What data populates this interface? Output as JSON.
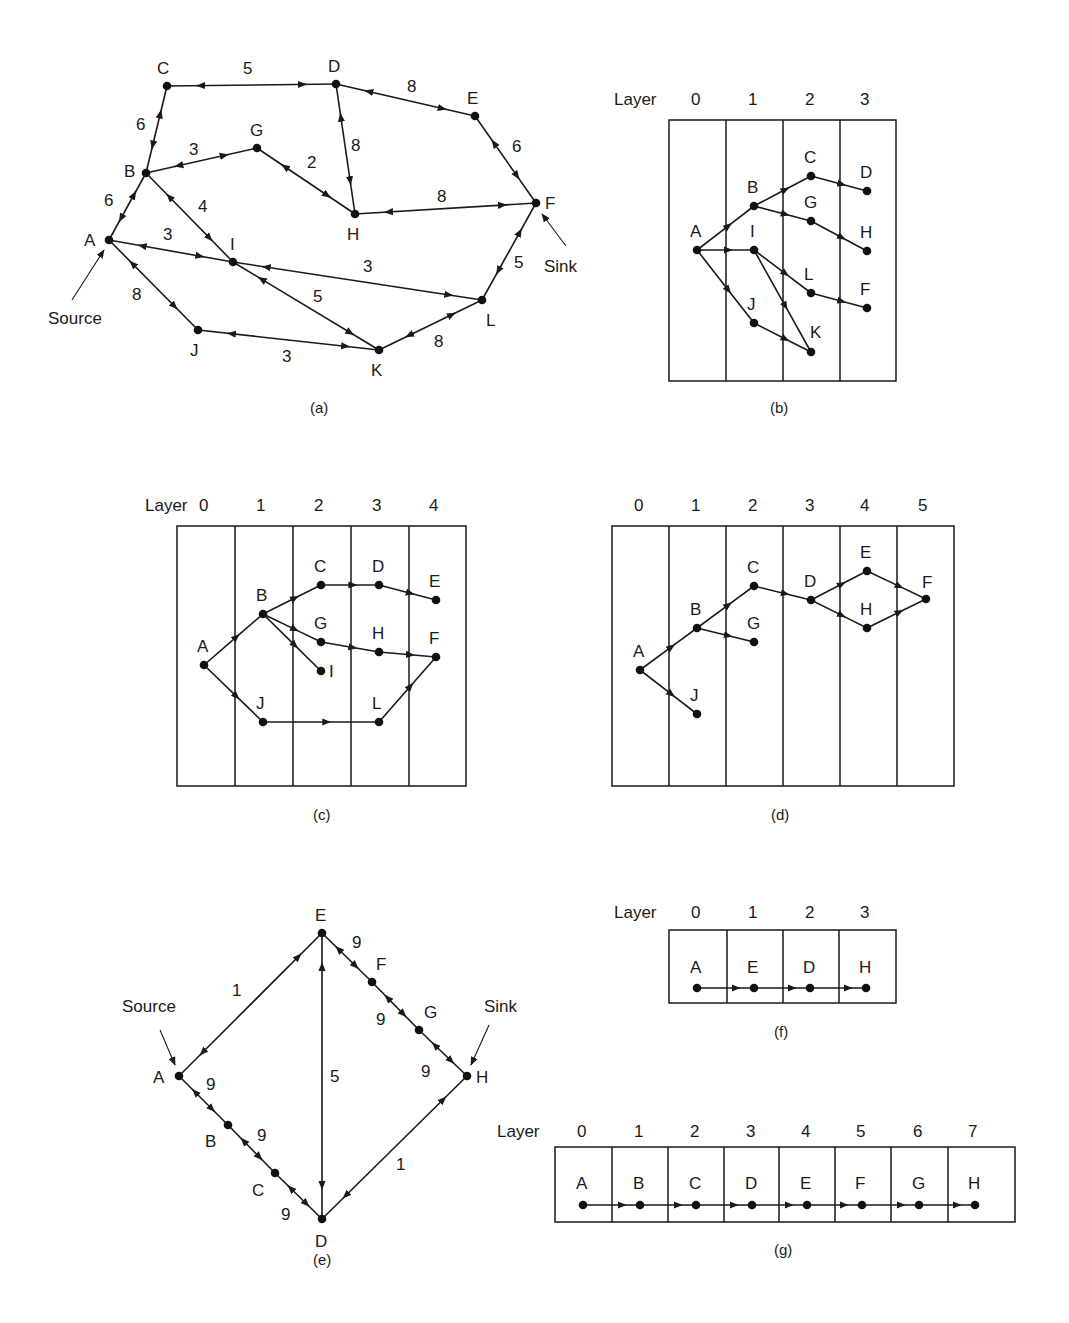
{
  "figure": {
    "panels": [
      {
        "id": "a",
        "caption": "(a)",
        "type": "weighted-bidirectional-graph",
        "source_label": "Source",
        "sink_label": "Sink",
        "source_node": "A",
        "sink_node": "F",
        "nodes": [
          {
            "id": "A",
            "x": 109,
            "y": 240,
            "lx": 84,
            "ly": 246
          },
          {
            "id": "B",
            "x": 146,
            "y": 173,
            "lx": 124,
            "ly": 177
          },
          {
            "id": "C",
            "x": 167,
            "y": 86,
            "lx": 157,
            "ly": 74
          },
          {
            "id": "D",
            "x": 336,
            "y": 84,
            "lx": 328,
            "ly": 72
          },
          {
            "id": "E",
            "x": 475,
            "y": 116,
            "lx": 467,
            "ly": 104
          },
          {
            "id": "F",
            "x": 536,
            "y": 203,
            "lx": 545,
            "ly": 209
          },
          {
            "id": "G",
            "x": 257,
            "y": 148,
            "lx": 250,
            "ly": 136
          },
          {
            "id": "H",
            "x": 355,
            "y": 214,
            "lx": 347,
            "ly": 240
          },
          {
            "id": "I",
            "x": 233,
            "y": 262,
            "lx": 230,
            "ly": 250
          },
          {
            "id": "J",
            "x": 198,
            "y": 330,
            "lx": 190,
            "ly": 356
          },
          {
            "id": "K",
            "x": 379,
            "y": 350,
            "lx": 371,
            "ly": 376
          },
          {
            "id": "L",
            "x": 482,
            "y": 300,
            "lx": 486,
            "ly": 326
          }
        ],
        "edges": [
          {
            "from": "C",
            "to": "D",
            "w": "5",
            "wx": 243,
            "wy": 74
          },
          {
            "from": "D",
            "to": "E",
            "w": "8",
            "wx": 407,
            "wy": 92
          },
          {
            "from": "B",
            "to": "C",
            "w": "6",
            "wx": 136,
            "wy": 130
          },
          {
            "from": "D",
            "to": "H",
            "w": "8",
            "wx": 351,
            "wy": 151
          },
          {
            "from": "E",
            "to": "F",
            "w": "6",
            "wx": 512,
            "wy": 152
          },
          {
            "from": "B",
            "to": "G",
            "w": "3",
            "wx": 189,
            "wy": 155
          },
          {
            "from": "G",
            "to": "H",
            "w": "2",
            "wx": 307,
            "wy": 168
          },
          {
            "from": "H",
            "to": "F",
            "w": "8",
            "wx": 437,
            "wy": 202
          },
          {
            "from": "A",
            "to": "B",
            "w": "6",
            "wx": 104,
            "wy": 206
          },
          {
            "from": "B",
            "to": "I",
            "w": "4",
            "wx": 198,
            "wy": 212
          },
          {
            "from": "A",
            "to": "I",
            "w": "3",
            "wx": 163,
            "wy": 240
          },
          {
            "from": "I",
            "to": "L",
            "w": "3",
            "wx": 363,
            "wy": 272
          },
          {
            "from": "F",
            "to": "L",
            "w": "5",
            "wx": 514,
            "wy": 268
          },
          {
            "from": "A",
            "to": "J",
            "w": "8",
            "wx": 132,
            "wy": 300
          },
          {
            "from": "I",
            "to": "K",
            "w": "5",
            "wx": 313,
            "wy": 302
          },
          {
            "from": "J",
            "to": "K",
            "w": "3",
            "wx": 282,
            "wy": 362
          },
          {
            "from": "K",
            "to": "L",
            "w": "8",
            "wx": 434,
            "wy": 347
          }
        ]
      },
      {
        "id": "b",
        "caption": "(b)",
        "type": "layered-graph",
        "layer_heading": "Layer",
        "layers": [
          "0",
          "1",
          "2",
          "3"
        ],
        "node_layers": {
          "0": [
            "A"
          ],
          "1": [
            "B",
            "I",
            "J"
          ],
          "2": [
            "C",
            "G",
            "L",
            "K"
          ],
          "3": [
            "D",
            "H",
            "F"
          ]
        },
        "edges": [
          [
            "A",
            "B"
          ],
          [
            "A",
            "I"
          ],
          [
            "A",
            "J"
          ],
          [
            "B",
            "C"
          ],
          [
            "B",
            "G"
          ],
          [
            "C",
            "D"
          ],
          [
            "G",
            "H"
          ],
          [
            "I",
            "L"
          ],
          [
            "I",
            "K"
          ],
          [
            "J",
            "K"
          ],
          [
            "L",
            "F"
          ]
        ]
      },
      {
        "id": "c",
        "caption": "(c)",
        "type": "layered-graph",
        "layer_heading": "Layer",
        "layers": [
          "0",
          "1",
          "2",
          "3",
          "4"
        ],
        "node_layers": {
          "0": [
            "A"
          ],
          "1": [
            "B",
            "J"
          ],
          "2": [
            "C",
            "G",
            "I"
          ],
          "3": [
            "D",
            "H",
            "L"
          ],
          "4": [
            "E",
            "F"
          ]
        },
        "edges": [
          [
            "A",
            "B"
          ],
          [
            "A",
            "J"
          ],
          [
            "B",
            "C"
          ],
          [
            "B",
            "G"
          ],
          [
            "B",
            "I"
          ],
          [
            "C",
            "D"
          ],
          [
            "D",
            "E"
          ],
          [
            "G",
            "H"
          ],
          [
            "H",
            "F"
          ],
          [
            "J",
            "L"
          ],
          [
            "L",
            "F"
          ]
        ]
      },
      {
        "id": "d",
        "caption": "(d)",
        "type": "layered-graph",
        "layer_heading": "",
        "layers": [
          "0",
          "1",
          "2",
          "3",
          "4",
          "5"
        ],
        "node_layers": {
          "0": [
            "A"
          ],
          "1": [
            "B",
            "J"
          ],
          "2": [
            "C",
            "G"
          ],
          "3": [
            "D"
          ],
          "4": [
            "E",
            "H"
          ],
          "5": [
            "F"
          ]
        },
        "edges": [
          [
            "A",
            "B"
          ],
          [
            "A",
            "J"
          ],
          [
            "B",
            "C"
          ],
          [
            "B",
            "G"
          ],
          [
            "C",
            "D"
          ],
          [
            "D",
            "E"
          ],
          [
            "D",
            "H"
          ],
          [
            "E",
            "F"
          ],
          [
            "H",
            "F"
          ]
        ]
      },
      {
        "id": "e",
        "caption": "(e)",
        "type": "weighted-bidirectional-graph",
        "source_label": "Source",
        "sink_label": "Sink",
        "source_node": "A",
        "sink_node": "H",
        "nodes": [
          "A",
          "B",
          "C",
          "D",
          "E",
          "F",
          "G",
          "H"
        ],
        "edges": [
          {
            "from": "A",
            "to": "E",
            "w": "1"
          },
          {
            "from": "E",
            "to": "D",
            "w": "5"
          },
          {
            "from": "D",
            "to": "H",
            "w": "1"
          },
          {
            "from": "A",
            "to": "B",
            "w": "9"
          },
          {
            "from": "B",
            "to": "C",
            "w": "9"
          },
          {
            "from": "C",
            "to": "D",
            "w": "9"
          },
          {
            "from": "E",
            "to": "F",
            "w": "9"
          },
          {
            "from": "F",
            "to": "G",
            "w": "9"
          },
          {
            "from": "G",
            "to": "H",
            "w": "9"
          }
        ]
      },
      {
        "id": "f",
        "caption": "(f)",
        "type": "layered-path",
        "layer_heading": "Layer",
        "layers": [
          "0",
          "1",
          "2",
          "3"
        ],
        "path": [
          "A",
          "E",
          "D",
          "H"
        ]
      },
      {
        "id": "g",
        "caption": "(g)",
        "type": "layered-path",
        "layer_heading": "Layer",
        "layers": [
          "0",
          "1",
          "2",
          "3",
          "4",
          "5",
          "6",
          "7"
        ],
        "path": [
          "A",
          "B",
          "C",
          "D",
          "E",
          "F",
          "G",
          "H"
        ]
      }
    ]
  }
}
